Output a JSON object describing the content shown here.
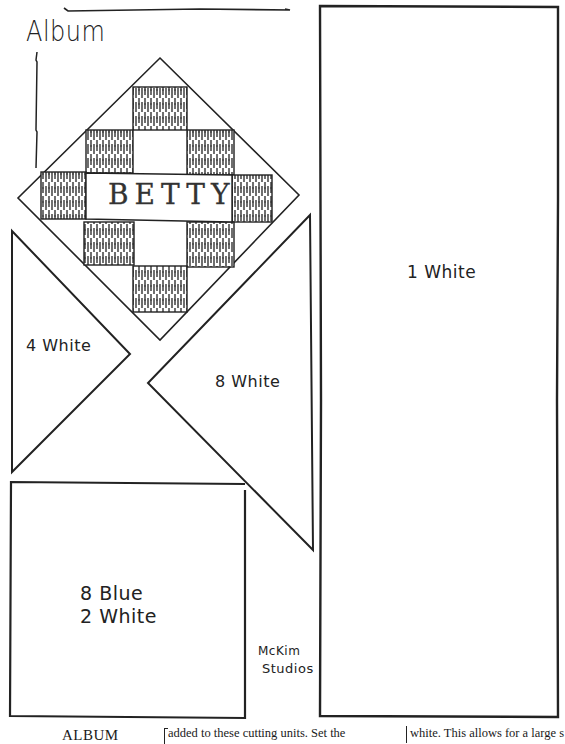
{
  "pattern": {
    "title": "Album",
    "block_name": "BETTY",
    "publisher": {
      "line1": "McKim",
      "line2": "Studios"
    }
  },
  "pieces": [
    {
      "id": "triangle-small",
      "label": "4 White",
      "shape": "triangle"
    },
    {
      "id": "triangle-large",
      "label": "8 White",
      "shape": "triangle"
    },
    {
      "id": "rectangle-long",
      "label": "1 White",
      "shape": "rectangle"
    },
    {
      "id": "square",
      "label_line1": "8 Blue",
      "label_line2": "2 White",
      "shape": "square"
    }
  ],
  "footer": {
    "heading": "ALBUM",
    "column1_text": "added to these cutting units.  Set the",
    "column2_text": "white.   This allows for a large s"
  },
  "colors": {
    "ink": "#1a1a1a",
    "paper": "#ffffff"
  }
}
